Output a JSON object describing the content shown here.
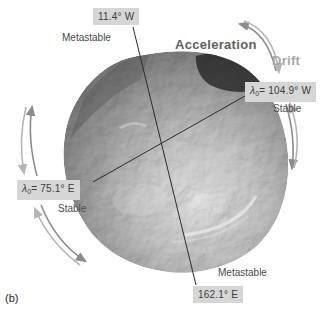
{
  "figure_label": "(b)",
  "annotations": {
    "acceleration_label": "Acceleration",
    "drift_label": "Drift"
  },
  "longitudes": {
    "top": {
      "value": "11.4° W",
      "stability": "Metastable"
    },
    "right": {
      "lambda": "λ",
      "lambda_sub": "0",
      "value": "= 104.9° W",
      "stability": "Stable"
    },
    "left": {
      "lambda": "λ",
      "lambda_sub": "0",
      "value": "= 75.1° E",
      "stability": "Stable"
    },
    "bottom": {
      "value": "162.1° E",
      "stability": "Metastable"
    }
  },
  "icons": {
    "arrows": [
      "acceleration-arrow-icon",
      "drift-arrow-icon",
      "libration-arrow-right-icon",
      "libration-arrow-left-upper-icon",
      "libration-arrow-left-lower-icon"
    ]
  },
  "colors": {
    "label_box_bg": "#d6d6d6",
    "label_text": "#3c3c3c",
    "axis_line": "#2b2b2b",
    "arrow_dark": "#8c8c8c",
    "arrow_light": "#b5b5b5",
    "acceleration_text": "#606060",
    "drift_text": "#a8a8a8"
  }
}
